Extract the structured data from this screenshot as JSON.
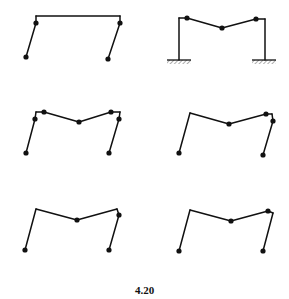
{
  "figure": {
    "caption": "4.20",
    "stroke_color": "#111111",
    "background": "#ffffff"
  },
  "panels": [
    {
      "id": "fixed-frame",
      "lines": [
        [
          36,
          16,
          120,
          16
        ],
        [
          36,
          16,
          36,
          23
        ],
        [
          120,
          16,
          120,
          23
        ],
        [
          36,
          23,
          26,
          57
        ],
        [
          120,
          23,
          108,
          59
        ]
      ],
      "hinges": [
        [
          36,
          23
        ],
        [
          26,
          57
        ],
        [
          120,
          23
        ],
        [
          108,
          59
        ]
      ],
      "supports": []
    },
    {
      "id": "beam-mechanism-fixed-base",
      "lines": [
        [
          179,
          60,
          179,
          18
        ],
        [
          179,
          18,
          187,
          18
        ],
        [
          187,
          18,
          222,
          28
        ],
        [
          222,
          28,
          256,
          19
        ],
        [
          256,
          19,
          265,
          19
        ],
        [
          265,
          19,
          265,
          60
        ]
      ],
      "hinges": [
        [
          187,
          18
        ],
        [
          222,
          28
        ],
        [
          256,
          19
        ]
      ],
      "supports": [
        [
          167,
          60,
          191
        ],
        [
          252,
          60,
          276
        ]
      ]
    },
    {
      "id": "combined-mechanism-6-hinge",
      "lines": [
        [
          26,
          153,
          35,
          119
        ],
        [
          35,
          119,
          36,
          112
        ],
        [
          36,
          112,
          44,
          112
        ],
        [
          44,
          112,
          79,
          122
        ],
        [
          79,
          122,
          111,
          112
        ],
        [
          111,
          112,
          120,
          112
        ],
        [
          120,
          112,
          119,
          119
        ],
        [
          119,
          119,
          109,
          153
        ]
      ],
      "hinges": [
        [
          26,
          153
        ],
        [
          35,
          119
        ],
        [
          44,
          112
        ],
        [
          79,
          122
        ],
        [
          111,
          112
        ],
        [
          119,
          119
        ],
        [
          109,
          153
        ]
      ],
      "supports": []
    },
    {
      "id": "combined-mechanism-right",
      "lines": [
        [
          179,
          153,
          190,
          113
        ],
        [
          190,
          113,
          229,
          124
        ],
        [
          229,
          124,
          266,
          114
        ],
        [
          266,
          114,
          272,
          114
        ],
        [
          272,
          114,
          273,
          121
        ],
        [
          273,
          121,
          263,
          155
        ]
      ],
      "hinges": [
        [
          179,
          153
        ],
        [
          229,
          124
        ],
        [
          266,
          114
        ],
        [
          273,
          121
        ],
        [
          263,
          155
        ]
      ],
      "supports": []
    },
    {
      "id": "combined-mechanism-a",
      "lines": [
        [
          25,
          250,
          36,
          209
        ],
        [
          36,
          209,
          77,
          220
        ],
        [
          77,
          220,
          117,
          209
        ],
        [
          117,
          209,
          119,
          215
        ],
        [
          119,
          215,
          109,
          250
        ]
      ],
      "hinges": [
        [
          25,
          250
        ],
        [
          77,
          220
        ],
        [
          119,
          215
        ],
        [
          109,
          250
        ]
      ],
      "supports": []
    },
    {
      "id": "combined-mechanism-b",
      "lines": [
        [
          179,
          251,
          190,
          210
        ],
        [
          190,
          210,
          231,
          221
        ],
        [
          231,
          221,
          268,
          211
        ],
        [
          268,
          211,
          273,
          213
        ],
        [
          273,
          213,
          263,
          251
        ]
      ],
      "hinges": [
        [
          179,
          251
        ],
        [
          231,
          221
        ],
        [
          268,
          211
        ],
        [
          263,
          251
        ]
      ],
      "supports": []
    }
  ]
}
